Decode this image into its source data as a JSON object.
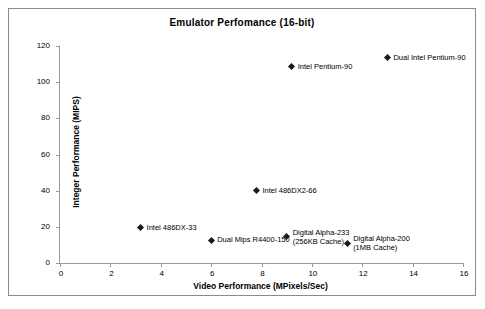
{
  "chart_data": {
    "type": "scatter",
    "title": "Emulator Perfomance (16-bit)",
    "xlabel": "Video Performance (MPixels/Sec)",
    "ylabel": "Integer Performance (MIPS)",
    "xlim": [
      0,
      16
    ],
    "ylim": [
      0,
      120
    ],
    "xticks": [
      "0",
      "2",
      "4",
      "6",
      "8",
      "10",
      "12",
      "14",
      "16"
    ],
    "xtick_values": [
      0,
      2,
      4,
      6,
      8,
      10,
      12,
      14,
      16
    ],
    "yticks": [
      "0",
      "20",
      "40",
      "60",
      "80",
      "100",
      "120"
    ],
    "ytick_values": [
      0,
      20,
      40,
      60,
      80,
      100,
      120
    ],
    "grid": false,
    "legend": "none",
    "marker": "diamond",
    "marker_color": "#1a1a1a",
    "points": [
      {
        "label": "Intel 486DX-33",
        "label_lines": [
          "Intel 486DX-33"
        ],
        "x": 3.2,
        "y": 19.5,
        "label_position": "right"
      },
      {
        "label": "Dual Mips R4400-150",
        "label_lines": [
          "Dual Mips R4400-150"
        ],
        "x": 6.0,
        "y": 12.5,
        "label_position": "right"
      },
      {
        "label": "Intel 486DX2-66",
        "label_lines": [
          "Intel 486DX2-66"
        ],
        "x": 7.8,
        "y": 40.0,
        "label_position": "right"
      },
      {
        "label": "Digital Alpha-233 (256KB Cache)",
        "label_lines": [
          "Digital Alpha-233",
          "(256KB Cache)"
        ],
        "x": 9.0,
        "y": 14.5,
        "label_position": "right"
      },
      {
        "label": "Digital Alpha-200 (1MB Cache)",
        "label_lines": [
          "Digital Alpha-200",
          "(1MB Cache)"
        ],
        "x": 11.4,
        "y": 11.0,
        "label_position": "right"
      },
      {
        "label": "Intel Pentium-90",
        "label_lines": [
          "Intel Pentium-90"
        ],
        "x": 9.2,
        "y": 108.5,
        "label_position": "right"
      },
      {
        "label": "Dual Intel Pentium-90",
        "label_lines": [
          "Dual Intel Pentium-90"
        ],
        "x": 13.0,
        "y": 113.5,
        "label_position": "right"
      }
    ]
  }
}
